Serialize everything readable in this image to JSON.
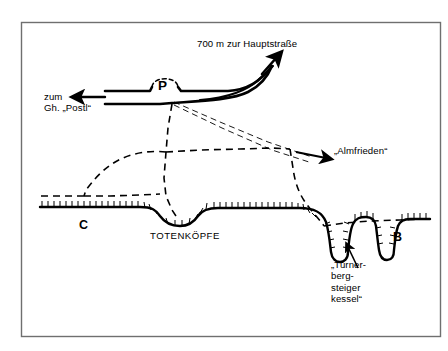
{
  "figure": {
    "kind": "schematic-terrain-map",
    "background_color": "#ffffff",
    "ink_color": "#000000",
    "frame_color": "#6b6b6b"
  },
  "labels": {
    "main_road": "700 m zur Hauptstraße",
    "to_inn_line1": "zum",
    "to_inn_line2": "Gh. „Postl“",
    "parking": "P",
    "almfrieden": "„Almfrieden“",
    "totenkoepfe": "TOTENKÖPFE",
    "point_c": "C",
    "point_b": "B",
    "kessel_line1": "„Turner-",
    "kessel_line2": "berg-",
    "kessel_line3": "steiger",
    "kessel_line4": "kessel“"
  },
  "icons": {
    "arrow_to_main_road": "arrow-up-right-icon",
    "arrow_to_postl": "arrow-left-icon",
    "arrow_to_almfrieden": "arrow-right-icon",
    "arrow_to_kessel": "arrow-up-icon"
  },
  "geometry": {
    "frame": {
      "x": 21,
      "y": 22,
      "width": 420,
      "height": 315
    },
    "terrain_profile_note": "hachured karst surface with TOTENKÖPFE hollow and two deep shafts",
    "dashed_trails_note": "footpath network linking P with Almfrieden, C and B"
  }
}
